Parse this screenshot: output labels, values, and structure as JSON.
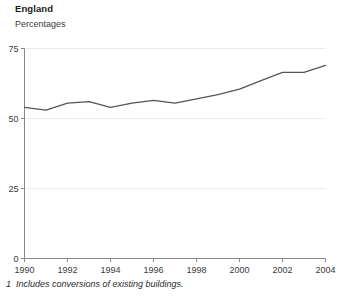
{
  "header": {
    "title": "England",
    "subtitle": "Percentages"
  },
  "footnote": {
    "marker": "1",
    "text": "Includes conversions of existing buildings."
  },
  "colors": {
    "line": "#555555",
    "axis": "#888888",
    "grid": "#eceaea",
    "text": "#3a3a3a",
    "background": "#ffffff"
  },
  "chart_data": {
    "type": "line",
    "title": "England",
    "subtitle": "Percentages",
    "xlabel": "",
    "ylabel": "Percentages",
    "xlim": [
      1990,
      2004
    ],
    "ylim": [
      0,
      75
    ],
    "yticks": [
      0,
      25,
      50,
      75
    ],
    "ytick_labels": [
      "0",
      "25",
      "50",
      "75"
    ],
    "xticks": [
      1990,
      1992,
      1994,
      1996,
      1998,
      2000,
      2002,
      2004
    ],
    "xtick_labels": [
      "1990",
      "1992",
      "1994",
      "1996",
      "1998",
      "2000",
      "2002",
      "2004"
    ],
    "grid": true,
    "grid_axis": "y",
    "legend": false,
    "x": [
      1990,
      1991,
      1992,
      1993,
      1994,
      1995,
      1996,
      1997,
      1998,
      1999,
      2000,
      2001,
      2002,
      2003,
      2004
    ],
    "series": [
      {
        "name": "Percentage of new dwellings on previously developed land",
        "values": [
          54,
          53,
          55.5,
          56,
          54,
          55.5,
          56.5,
          55.5,
          57,
          58.5,
          60.5,
          63.5,
          66.5,
          66.5,
          69
        ]
      }
    ]
  }
}
